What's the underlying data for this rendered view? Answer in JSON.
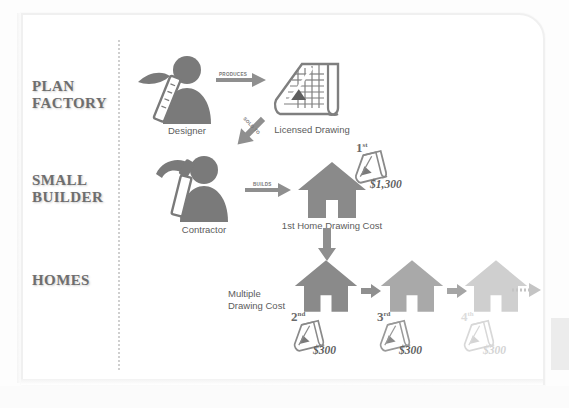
{
  "diagram": {
    "colors": {
      "figure": "#7a7a7a",
      "house_dark": "#8a8a8a",
      "house_mid": "#a9a9a9",
      "house_light": "#cfcfcf",
      "arrow": "#8f8f8f",
      "label": "#6e6e6e",
      "divider": "#cfcfcf",
      "frame": "#f0f0f0"
    },
    "row_labels": [
      {
        "id": "plan-factory",
        "line1": "PLAN",
        "line2": "FACTORY"
      },
      {
        "id": "small-builder",
        "line1": "SMALL",
        "line2": "BUILDER"
      },
      {
        "id": "homes",
        "line1": "HOMES",
        "line2": ""
      }
    ],
    "nodes": {
      "designer": {
        "caption": "Designer",
        "icon": "designer-icon"
      },
      "licensed_drawing": {
        "caption": "Licensed Drawing",
        "icon": "blueprint-icon"
      },
      "contractor": {
        "caption": "Contractor",
        "icon": "contractor-icon"
      },
      "first_home": {
        "caption": "1st Home Drawing Cost",
        "icon": "house-icon"
      }
    },
    "arrows": {
      "produces": {
        "label": "PRODUCES",
        "direction": "right"
      },
      "sold_to": {
        "label": "SOLD TO",
        "direction": "down-left"
      },
      "builds": {
        "label": "BUILDS",
        "direction": "right"
      },
      "to_homes": {
        "label": "",
        "direction": "down"
      },
      "home_chain_1": {
        "label": "",
        "direction": "right"
      },
      "home_chain_2": {
        "label": "",
        "direction": "right"
      },
      "continues": {
        "label": "",
        "direction": "right-dotted"
      }
    },
    "first_home_cost": {
      "ordinal_number": "1",
      "ordinal_suffix": "st",
      "price": "$1,300"
    },
    "multiple_label": {
      "line1": "Multiple",
      "line2": "Drawing Cost"
    },
    "homes": [
      {
        "ordinal_number": "2",
        "ordinal_suffix": "nd",
        "price": "$300",
        "shade": "dark",
        "faded": false
      },
      {
        "ordinal_number": "3",
        "ordinal_suffix": "rd",
        "price": "$300",
        "shade": "mid",
        "faded": false
      },
      {
        "ordinal_number": "4",
        "ordinal_suffix": "th",
        "price": "$300",
        "shade": "light",
        "faded": true
      }
    ]
  }
}
